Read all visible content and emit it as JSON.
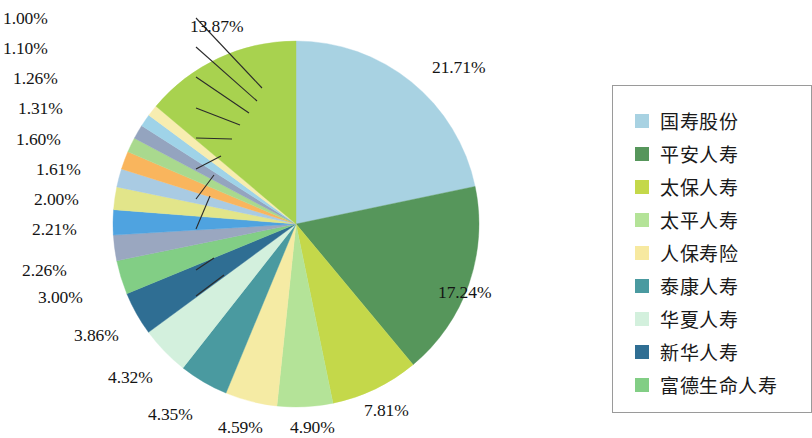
{
  "chart_data": {
    "type": "pie",
    "title": "",
    "subtitle": "",
    "xlabel": "",
    "ylabel": "",
    "unit": "%",
    "grid": false,
    "legend_position": "right",
    "start_angle_deg": 0,
    "direction": "clockwise",
    "categories": [
      "国寿股份",
      "平安人寿",
      "太保人寿",
      "太平人寿",
      "人保寿险",
      "泰康人寿",
      "华夏人寿",
      "新华人寿",
      "富德生命人寿"
    ],
    "slices": [
      {
        "label": "21.71%",
        "value": 21.71,
        "color": "#a8d2e2"
      },
      {
        "label": "17.24%",
        "value": 17.24,
        "color": "#56965b"
      },
      {
        "label": "7.81%",
        "value": 7.81,
        "color": "#c4d84a"
      },
      {
        "label": "4.90%",
        "value": 4.9,
        "color": "#b4e398"
      },
      {
        "label": "4.59%",
        "value": 4.59,
        "color": "#f5eba4"
      },
      {
        "label": "4.35%",
        "value": 4.35,
        "color": "#4a9aa0"
      },
      {
        "label": "4.32%",
        "value": 4.32,
        "color": "#d3f0dd"
      },
      {
        "label": "3.86%",
        "value": 3.86,
        "color": "#2f6e93"
      },
      {
        "label": "3.00%",
        "value": 3.0,
        "color": "#82ce85"
      },
      {
        "label": "2.26%",
        "value": 2.26,
        "color": "#9aa7c0"
      },
      {
        "label": "2.21%",
        "value": 2.21,
        "color": "#4fa3e0"
      },
      {
        "label": "2.00%",
        "value": 2.0,
        "color": "#e2e58a"
      },
      {
        "label": "1.61%",
        "value": 1.61,
        "color": "#a9cbe3"
      },
      {
        "label": "1.60%",
        "value": 1.6,
        "color": "#f9b55d"
      },
      {
        "label": "1.31%",
        "value": 1.31,
        "color": "#a9d98e"
      },
      {
        "label": "1.26%",
        "value": 1.26,
        "color": "#94a4bf"
      },
      {
        "label": "1.10%",
        "value": 1.1,
        "color": "#9fd3e8"
      },
      {
        "label": "1.00%",
        "value": 1.0,
        "color": "#f7edb0"
      },
      {
        "label": "13.87%",
        "value": 13.87,
        "color": "#a8d24f"
      }
    ]
  },
  "labels": {
    "p_21_71": "21.71%",
    "p_17_24": "17.24%",
    "p_7_81": "7.81%",
    "p_4_90": "4.90%",
    "p_4_59": "4.59%",
    "p_4_35": "4.35%",
    "p_4_32": "4.32%",
    "p_3_86": "3.86%",
    "p_3_00": "3.00%",
    "p_2_26": "2.26%",
    "p_2_21": "2.21%",
    "p_2_00": "2.00%",
    "p_1_61": "1.61%",
    "p_1_60": "1.60%",
    "p_1_31": "1.31%",
    "p_1_26": "1.26%",
    "p_1_10": "1.10%",
    "p_1_00": "1.00%",
    "p_13_87": "13.87%"
  },
  "legend": {
    "items": [
      {
        "label": "国寿股份",
        "color": "#a8d2e2"
      },
      {
        "label": "平安人寿",
        "color": "#56965b"
      },
      {
        "label": "太保人寿",
        "color": "#c4d84a"
      },
      {
        "label": "太平人寿",
        "color": "#b4e398"
      },
      {
        "label": "人保寿险",
        "color": "#f7e9a0"
      },
      {
        "label": "泰康人寿",
        "color": "#4a9aa0"
      },
      {
        "label": "华夏人寿",
        "color": "#d3f0dd"
      },
      {
        "label": "新华人寿",
        "color": "#2f6e93"
      },
      {
        "label": "富德生命人寿",
        "color": "#82ce85"
      }
    ]
  }
}
